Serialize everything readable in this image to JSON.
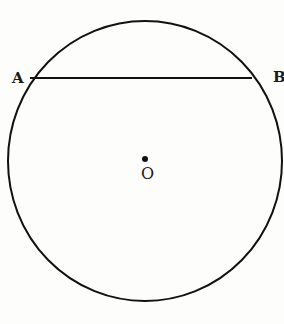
{
  "diagram": {
    "type": "geometry",
    "circle": {
      "cx": 145,
      "cy": 161,
      "rx": 137,
      "ry": 140,
      "stroke": "#111111",
      "stroke_width": 2
    },
    "chord": {
      "from": "A",
      "to": "B",
      "x1": 30,
      "y1": 78,
      "x2": 252,
      "y2": 78
    },
    "center_point": {
      "x": 145,
      "y": 159,
      "r": 3
    },
    "labels": {
      "a": "A",
      "b": "B",
      "o": "O"
    }
  }
}
